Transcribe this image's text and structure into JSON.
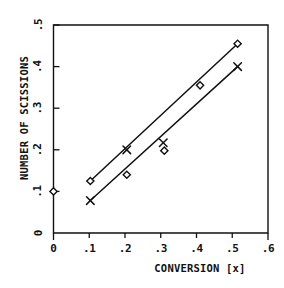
{
  "chart_data": {
    "type": "scatter",
    "title": "",
    "xlabel": "CONVERSION [x]",
    "ylabel": "NUMBER OF SCISSIONS",
    "xlim": [
      0,
      0.6
    ],
    "ylim": [
      0,
      0.5
    ],
    "grid": false,
    "legend": "none",
    "xticks": [
      0,
      0.1,
      0.2,
      0.3,
      0.4,
      0.5,
      0.6
    ],
    "xtick_labels": [
      "0",
      ".1",
      ".2",
      ".3",
      ".4",
      ".5",
      ".6"
    ],
    "yticks": [
      0,
      0.1,
      0.2,
      0.3,
      0.4,
      0.5
    ],
    "ytick_labels": [
      "0",
      ".1",
      ".2",
      ".3",
      ".4",
      ".5"
    ],
    "series": [
      {
        "name": "diamond-series",
        "marker": "diamond",
        "connected": true,
        "points": [
          {
            "x": 0.0,
            "y": 0.1
          },
          {
            "x": 0.103,
            "y": 0.125
          },
          {
            "x": 0.205,
            "y": 0.14
          },
          {
            "x": 0.31,
            "y": 0.198
          },
          {
            "x": 0.41,
            "y": 0.355
          },
          {
            "x": 0.515,
            "y": 0.455
          }
        ]
      },
      {
        "name": "cross-series",
        "marker": "x",
        "connected": true,
        "points": [
          {
            "x": 0.103,
            "y": 0.078
          },
          {
            "x": 0.205,
            "y": 0.2
          },
          {
            "x": 0.307,
            "y": 0.217
          },
          {
            "x": 0.515,
            "y": 0.4
          }
        ]
      }
    ],
    "fit_lines": [
      {
        "name": "diamond-trend",
        "from": {
          "x": 0.103,
          "y": 0.125
        },
        "to": {
          "x": 0.515,
          "y": 0.455
        }
      },
      {
        "name": "cross-trend",
        "from": {
          "x": 0.103,
          "y": 0.078
        },
        "to": {
          "x": 0.515,
          "y": 0.4
        }
      }
    ]
  }
}
